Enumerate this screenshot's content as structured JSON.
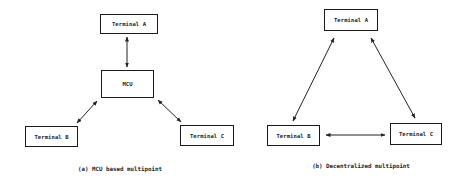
{
  "diagrams": [
    {
      "id": "a",
      "caption": "(a) MCU based multipoint",
      "nodes": {
        "terminal_a": "Terminal A",
        "mcu": "MCU",
        "terminal_b": "Terminal B",
        "terminal_c": "Terminal C"
      },
      "edges": [
        {
          "from": "Terminal A",
          "to": "MCU",
          "type": "bidirectional"
        },
        {
          "from": "MCU",
          "to": "Terminal B",
          "type": "bidirectional"
        },
        {
          "from": "MCU",
          "to": "Terminal C",
          "type": "bidirectional"
        }
      ]
    },
    {
      "id": "b",
      "caption": "(b) Decentralized multipoint",
      "nodes": {
        "terminal_a": "Terminal A",
        "terminal_b": "Terminal B",
        "terminal_c": "Terminal C"
      },
      "edges": [
        {
          "from": "Terminal A",
          "to": "Terminal B",
          "type": "bidirectional"
        },
        {
          "from": "Terminal A",
          "to": "Terminal C",
          "type": "bidirectional"
        },
        {
          "from": "Terminal B",
          "to": "Terminal C",
          "type": "bidirectional"
        }
      ]
    }
  ]
}
